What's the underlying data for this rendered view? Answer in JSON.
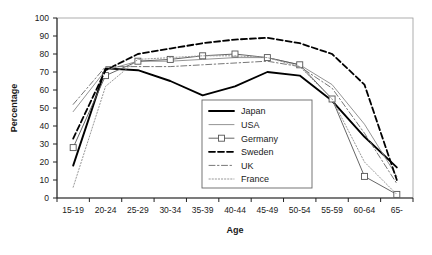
{
  "chart_data": {
    "type": "line",
    "title": "",
    "xlabel": "Age",
    "ylabel": "Percentage",
    "categories": [
      "15-19",
      "20-24",
      "25-29",
      "30-34",
      "35-39",
      "40-44",
      "45-49",
      "50-54",
      "55-59",
      "60-64",
      "65-"
    ],
    "ylim": [
      0,
      100
    ],
    "yticks": [
      0,
      10,
      20,
      30,
      40,
      50,
      60,
      70,
      80,
      90,
      100
    ],
    "grid": false,
    "legend_position": "center",
    "series": [
      {
        "name": "Japan",
        "style": "solid-thick",
        "color": "#000000",
        "values": [
          18,
          72,
          71,
          65,
          57,
          62,
          70,
          68,
          54,
          34,
          17
        ]
      },
      {
        "name": "USA",
        "style": "solid-thin",
        "color": "#888888",
        "values": [
          48,
          71,
          76,
          76,
          77,
          78,
          78,
          74,
          63,
          41,
          12
        ]
      },
      {
        "name": "Germany",
        "style": "square-marker",
        "color": "#555555",
        "values": [
          28,
          68,
          76,
          77,
          79,
          80,
          78,
          74,
          55,
          12,
          2
        ]
      },
      {
        "name": "Sweden",
        "style": "dashed",
        "color": "#000000",
        "values": [
          33,
          71,
          80,
          83,
          86,
          88,
          89,
          86,
          80,
          63,
          10
        ]
      },
      {
        "name": "UK",
        "style": "dash-dot",
        "color": "#777777",
        "values": [
          52,
          73,
          73,
          73,
          74,
          75,
          76,
          73,
          61,
          36,
          8
        ]
      },
      {
        "name": "France",
        "style": "dotted",
        "color": "#999999",
        "values": [
          6,
          62,
          77,
          78,
          79,
          79,
          78,
          73,
          55,
          20,
          2
        ]
      }
    ]
  },
  "legend": {
    "entries": [
      {
        "label": "Japan"
      },
      {
        "label": "USA"
      },
      {
        "label": "Germany"
      },
      {
        "label": "Sweden"
      },
      {
        "label": "UK"
      },
      {
        "label": "France"
      }
    ]
  }
}
